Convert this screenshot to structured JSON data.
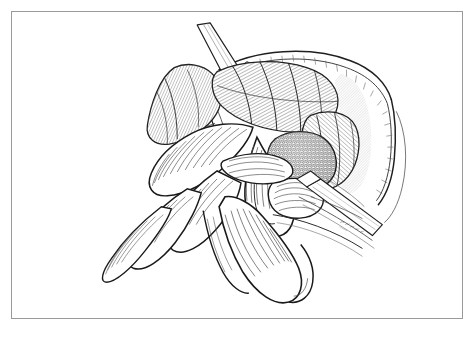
{
  "figure": {
    "domain": "medical-surgical-illustration",
    "medium": "pen-and-ink line drawing",
    "title": "Intraoperative view of open abdomen with bowel loops retracted and mesh-covered defect exposed",
    "frame_border_color": "#9a9a9a",
    "background_color": "#ffffff",
    "ink_color": "#1a1a1a",
    "hatch_color": "#555555",
    "stipple_color": "#3a3a3a",
    "artist_signature": "R. Niles",
    "caption_text": "",
    "elements": [
      {
        "name": "abdominal-wall-flap-upper-left",
        "label": "Retracted abdominal wall flap with suture row"
      },
      {
        "name": "suture-row",
        "label": "Running suture line along fascial edge"
      },
      {
        "name": "retractor-blade-top",
        "label": "Upper retractor blade"
      },
      {
        "name": "retractor-blade-right",
        "label": "Right lateral retractor blade"
      },
      {
        "name": "retractor-blade-lower",
        "label": "Lower retractor blade"
      },
      {
        "name": "bowel-loop-cluster",
        "label": "Cluster of small bowel loops"
      },
      {
        "name": "bowel-loop-pendant",
        "label": "Dependent bowel loop"
      },
      {
        "name": "mesh-patch",
        "label": "Stippled mesh-covered defect"
      },
      {
        "name": "peritoneal-edge",
        "label": "Cut peritoneal edge"
      }
    ]
  }
}
